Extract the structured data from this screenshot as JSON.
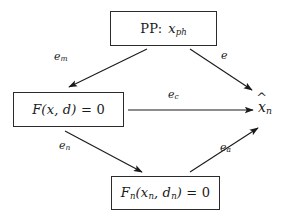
{
  "diagram": {
    "background_color": "#ffffff",
    "stroke_color": "#2b2b2b",
    "nodes": [
      {
        "id": "pp",
        "name": "physical-problem-node",
        "label": "PP :  x_ph",
        "label_main": "PP",
        "label_separator": ":",
        "label_var": "x",
        "label_var_sub": "ph",
        "shape": "rectangle",
        "x": 110,
        "y": 11,
        "width": 107,
        "height": 35
      },
      {
        "id": "model",
        "name": "continuous-model-node",
        "label": "F(x, d) = 0",
        "func": "F",
        "args": "(x, d)",
        "equals": "= 0",
        "shape": "rectangle",
        "x": 13,
        "y": 92,
        "width": 111,
        "height": 35
      },
      {
        "id": "discrete",
        "name": "discrete-model-node",
        "label": "F_n(x_n, d_n) = 0",
        "func": "F",
        "func_sub": "n",
        "args": "(x_n, d_n)",
        "equals": "= 0",
        "shape": "rectangle",
        "x": 111,
        "y": 176,
        "width": 109,
        "height": 34
      },
      {
        "id": "result",
        "name": "computed-solution-node",
        "label": "x̂_n",
        "label_var": "x",
        "label_var_sub": "n",
        "accent": "hat",
        "shape": "none",
        "x": 258,
        "y": 99
      }
    ],
    "edges": [
      {
        "id": "e_m",
        "name": "edge-modeling-error",
        "label": "e_m",
        "label_base": "e",
        "label_sub": "m",
        "from": "pp",
        "to": "model",
        "x1": 147,
        "y1": 49,
        "x2": 69,
        "y2": 87,
        "label_x": 60,
        "label_y": 56,
        "arrowhead": "end"
      },
      {
        "id": "e",
        "name": "edge-total-error",
        "label": "e",
        "label_base": "e",
        "label_sub": "",
        "from": "pp",
        "to": "result",
        "x1": 190,
        "y1": 49,
        "x2": 252,
        "y2": 90,
        "label_x": 224,
        "label_y": 55,
        "arrowhead": "end"
      },
      {
        "id": "e_c",
        "name": "edge-computational-error",
        "label": "e_c",
        "label_base": "e",
        "label_sub": "c",
        "from": "model",
        "to": "result",
        "x1": 128,
        "y1": 110,
        "x2": 253,
        "y2": 110,
        "label_x": 174,
        "label_y": 92,
        "arrowhead": "end"
      },
      {
        "id": "e_n",
        "name": "edge-numerical-error",
        "label": "e_n",
        "label_base": "e",
        "label_sub": "n",
        "from": "model",
        "to": "discrete",
        "x1": 65,
        "y1": 131,
        "x2": 142,
        "y2": 172,
        "label_x": 65,
        "label_y": 143,
        "arrowhead": "end"
      },
      {
        "id": "e_a",
        "name": "edge-algorithmic-error",
        "label": "e_a",
        "label_base": "e",
        "label_sub": "a",
        "from": "discrete",
        "to": "result",
        "x1": 190,
        "y1": 172,
        "x2": 258,
        "y2": 128,
        "label_x": 225,
        "label_y": 145,
        "arrowhead": "end"
      }
    ]
  }
}
